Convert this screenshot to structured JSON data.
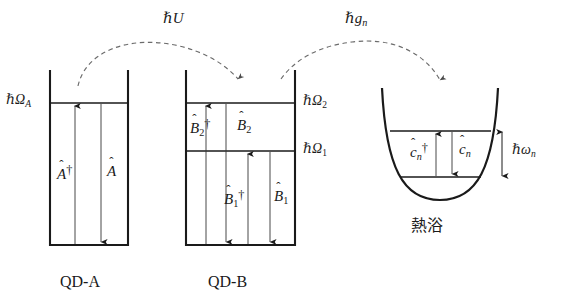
{
  "figure": {
    "type": "energy-level-diagram",
    "background": "#ffffff",
    "line_color": "#1a1a1a",
    "coupling_arrow_style": "dashed-curved"
  },
  "couplings": [
    {
      "id": "hU",
      "label_hbar": "ℏ",
      "label_sym": "U",
      "label_sub": "",
      "from": "QD-A",
      "to": "QD-B"
    },
    {
      "id": "hgn",
      "label_hbar": "ℏ",
      "label_sym": "g",
      "label_sub": "n",
      "from": "QD-B",
      "to": "bath"
    }
  ],
  "wells": [
    {
      "id": "qd-a",
      "caption": "QD-A",
      "shape": "square-well",
      "levels": [
        {
          "id": "omega-A",
          "hbar": "ℏ",
          "sym": "Ω",
          "sub": "A",
          "side": "left"
        }
      ],
      "operators": [
        {
          "id": "A-dagger",
          "base": "A",
          "dagger": true,
          "sub": "",
          "arrow": "up"
        },
        {
          "id": "A",
          "base": "A",
          "dagger": false,
          "sub": "",
          "arrow": "down"
        }
      ]
    },
    {
      "id": "qd-b",
      "caption": "QD-B",
      "shape": "square-well",
      "levels": [
        {
          "id": "omega-2",
          "hbar": "ℏ",
          "sym": "Ω",
          "sub": "2",
          "side": "right"
        },
        {
          "id": "omega-1",
          "hbar": "ℏ",
          "sym": "Ω",
          "sub": "1",
          "side": "right"
        }
      ],
      "operators": [
        {
          "id": "B2-dagger",
          "base": "B",
          "dagger": true,
          "sub": "2",
          "arrow": "up"
        },
        {
          "id": "B2",
          "base": "B",
          "dagger": false,
          "sub": "2",
          "arrow": "down"
        },
        {
          "id": "B1-dagger",
          "base": "B",
          "dagger": true,
          "sub": "1",
          "arrow": "up"
        },
        {
          "id": "B1",
          "base": "B",
          "dagger": false,
          "sub": "1",
          "arrow": "down"
        }
      ]
    },
    {
      "id": "bath",
      "caption": "熱浴",
      "shape": "harmonic-parabola",
      "levels": [
        {
          "id": "omega-n",
          "hbar": "ℏ",
          "sym": "ω",
          "sub": "n",
          "side": "right",
          "spacing_arrow": true
        }
      ],
      "operators": [
        {
          "id": "cn-dagger",
          "base": "c",
          "dagger": true,
          "sub": "n",
          "arrow": "up"
        },
        {
          "id": "cn",
          "base": "c",
          "dagger": false,
          "sub": "n",
          "arrow": "down"
        }
      ]
    }
  ],
  "text": {
    "qd_a_caption": "QD-A",
    "qd_b_caption": "QD-B",
    "bath_caption": "熱浴",
    "hbar": "ℏ",
    "omega_upper": "Ω",
    "omega_lower": "ω",
    "sym_U": "U",
    "sym_g": "g",
    "sym_A": "A",
    "sym_B": "B",
    "sym_c": "c",
    "sub_A": "A",
    "sub_1": "1",
    "sub_2": "2",
    "sub_n": "n",
    "dagger": "†",
    "hat": "ˆ"
  }
}
